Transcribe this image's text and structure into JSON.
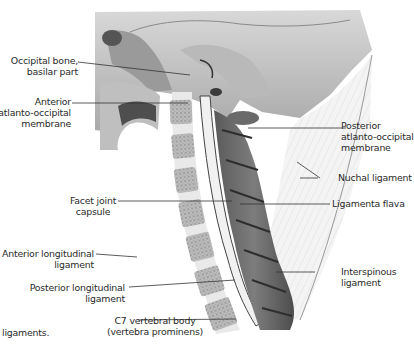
{
  "figure": {
    "caption_fragment": "ligaments.",
    "labels_left": [
      {
        "id": "occipital-bone",
        "text": [
          "Occipital bone,",
          "basilar part"
        ]
      },
      {
        "id": "anterior-atlanto-occipital-membrane",
        "text": [
          "Anterior",
          "atlanto-occipital",
          "membrane"
        ]
      },
      {
        "id": "facet-joint-capsule",
        "text": [
          "Facet joint",
          "capsule"
        ]
      },
      {
        "id": "anterior-longitudinal-ligament",
        "text": [
          "Anterior longitudinal",
          "ligament"
        ]
      },
      {
        "id": "posterior-longitudinal-ligament",
        "text": [
          "Posterior longitudinal",
          "ligament"
        ]
      },
      {
        "id": "c7-vertebral-body",
        "text": [
          "C7 vertebral body",
          "(vertebra prominens)"
        ]
      }
    ],
    "labels_right": [
      {
        "id": "posterior-atlanto-occipital-membrane",
        "text": [
          "Posterior",
          "atlanto-occipital",
          "membrane"
        ]
      },
      {
        "id": "nuchal-ligament",
        "text": [
          "Nuchal ligament"
        ]
      },
      {
        "id": "ligamenta-flava",
        "text": [
          "Ligamenta flava"
        ]
      },
      {
        "id": "interspinous-ligament",
        "text": [
          "Interspinous",
          "ligament"
        ]
      }
    ]
  }
}
